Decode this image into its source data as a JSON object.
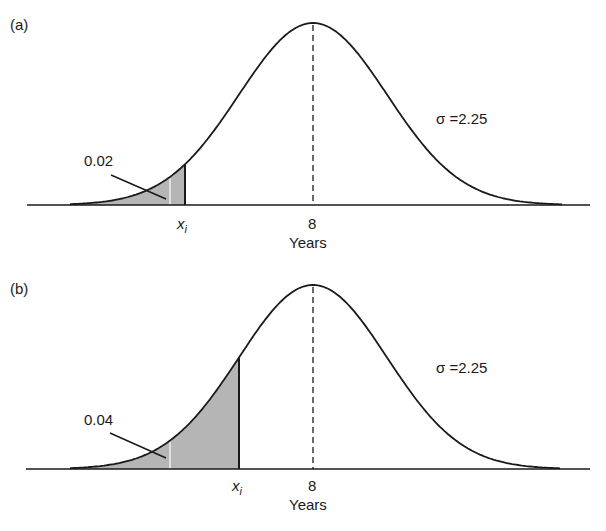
{
  "chart_data": [
    {
      "type": "area",
      "panel_label": "(a)",
      "title": "",
      "xlabel": "Years",
      "mean": 8,
      "sigma": 2.25,
      "sigma_label": "σ =2.25",
      "tick_labels": [
        "x_i",
        "8"
      ],
      "shaded_tail_area": 0.02,
      "shaded_tail_label": "0.02",
      "marker_label": "x",
      "marker_subscript": "i",
      "mean_tick": "8",
      "layout": {
        "baseline_y": 205,
        "peak_y": 23,
        "center_x": 313,
        "sigma_px": 74,
        "shade_to_x": 185,
        "white_line_x": 170,
        "curve_x0": 70,
        "curve_x1": 562,
        "axis_x0": 27,
        "axis_x1": 590
      }
    },
    {
      "type": "area",
      "panel_label": "(b)",
      "title": "",
      "xlabel": "Years",
      "mean": 8,
      "sigma": 2.25,
      "sigma_label": "σ =2.25",
      "tick_labels": [
        "x_i",
        "8"
      ],
      "shaded_tail_area": 0.04,
      "shaded_tail_label": "0.04",
      "marker_label": "x",
      "marker_subscript": "i",
      "mean_tick": "8",
      "layout": {
        "baseline_y": 469,
        "peak_y": 285,
        "center_x": 313,
        "sigma_px": 74,
        "shade_to_x": 239,
        "white_line_x": 170,
        "curve_x0": 70,
        "curve_x1": 560,
        "axis_x0": 26,
        "axis_x1": 590
      }
    }
  ],
  "colors": {
    "line": "#1a1a1a",
    "shade": "#b5b5b5",
    "background": "#ffffff"
  }
}
